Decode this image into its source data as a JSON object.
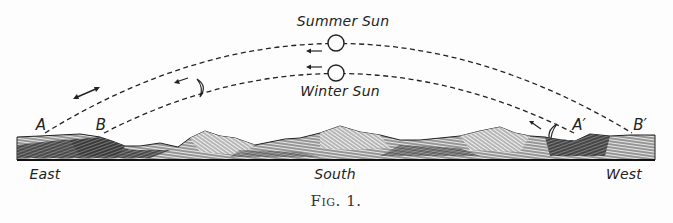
{
  "figure": {
    "caption": "Fig. 1.",
    "labels": {
      "summer_sun": "Summer Sun",
      "winter_sun": "Winter Sun",
      "east": "East",
      "south": "South",
      "west": "West"
    },
    "points": {
      "a": "A",
      "b": "B",
      "a_prime": "A′",
      "b_prime": "B′"
    },
    "icons": {
      "summer_sun": "circle",
      "winter_sun": "circle",
      "moon_left": "crescent",
      "moon_right": "crescent",
      "arrows": "left-arrow"
    },
    "colors": {
      "ink": "#222222",
      "paper": "#fdfdfd"
    }
  }
}
